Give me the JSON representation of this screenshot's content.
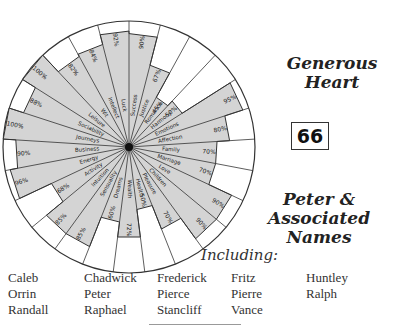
{
  "header": {
    "title_line1": "Generous",
    "title_line2": "Heart",
    "number": "66",
    "subtitle_line1": "Peter &",
    "subtitle_line2": "Associated Names",
    "including_label": "Including:"
  },
  "names": [
    [
      "Caleb",
      "Chadwick",
      "Frederick",
      "Fritz",
      "Huntley"
    ],
    [
      "Orrin",
      "Peter",
      "Pierce",
      "Pierre",
      "Ralph"
    ],
    [
      "Randall",
      "Raphael",
      "Stancliff",
      "Vance",
      ""
    ]
  ],
  "chart_data": {
    "type": "radar",
    "title": "Generous Heart",
    "categories": [
      "Success",
      "Justice",
      "Romance",
      "Harmony",
      "Emotions",
      "Affection",
      "Family",
      "Marriage",
      "Love",
      "Children",
      "Pleasure",
      "Health",
      "Wealth",
      "Dreams",
      "Sensuality",
      "Intuition",
      "Activity",
      "Energy",
      "Business",
      "Journeys",
      "Sociability",
      "Leisure",
      "Wit",
      "Intellect",
      "Luck"
    ],
    "values": [
      90,
      67,
      45,
      50,
      95,
      80,
      70,
      70,
      90,
      90,
      70,
      50,
      72,
      60,
      85,
      85,
      68,
      96,
      90,
      100,
      88,
      100,
      82,
      84,
      92
    ],
    "labels": [
      "90%",
      "67%",
      "45%",
      "50%",
      "95%",
      "80%",
      "70%",
      "70%",
      "90%",
      "90%",
      "70%",
      "50%",
      "72%",
      "60%",
      "85%",
      "85%",
      "68%",
      "96%",
      "90%",
      "100%",
      "88%",
      "100%",
      "82%",
      "84%",
      "92%"
    ],
    "range": [
      0,
      100
    ],
    "fill_color": "#d4d4d4",
    "line_color": "#333333"
  }
}
